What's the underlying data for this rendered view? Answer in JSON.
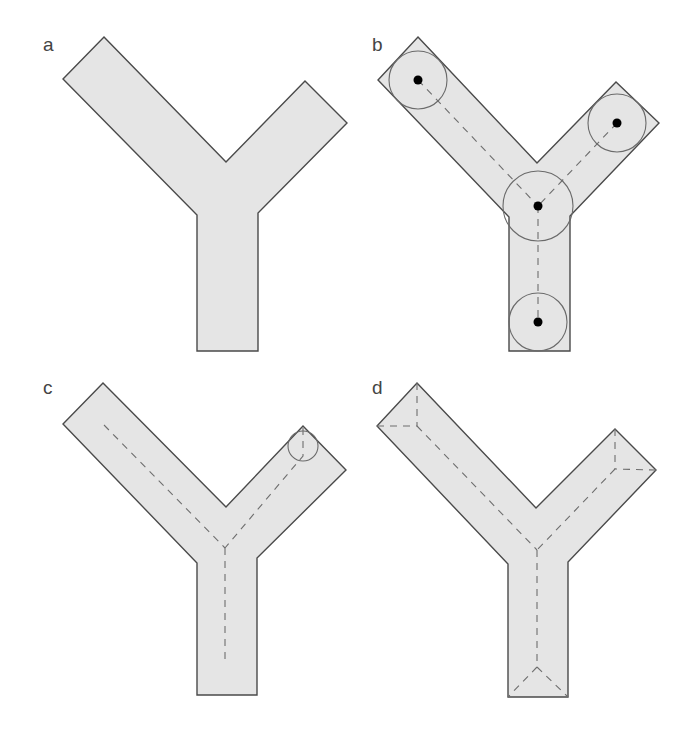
{
  "figure": {
    "fill_color": "#e5e5e5",
    "stroke_color": "#4a4a4a",
    "skeleton_color": "#6e6e6e",
    "panels": [
      {
        "label": "a",
        "label_pos": [
          43,
          51
        ],
        "shape": "Y-shaped polygon (plain)",
        "polygon": [
          [
            104,
            37
          ],
          [
            226,
            162
          ],
          [
            305,
            81
          ],
          [
            347,
            123
          ],
          [
            258,
            213
          ],
          [
            258,
            351
          ],
          [
            197,
            351
          ],
          [
            197,
            215
          ],
          [
            63,
            79
          ]
        ]
      },
      {
        "label": "b",
        "label_pos": [
          372,
          51
        ],
        "shape": "Y-shaped polygon with maximal inscribed disks and centers",
        "polygon": [
          [
            418,
            37
          ],
          [
            537,
            163
          ],
          [
            616,
            82
          ],
          [
            659,
            123
          ],
          [
            570,
            216
          ],
          [
            570,
            351
          ],
          [
            509,
            351
          ],
          [
            509,
            217
          ],
          [
            378,
            80
          ]
        ],
        "disks": [
          {
            "cx": 418,
            "cy": 80,
            "r": 29
          },
          {
            "cx": 617,
            "cy": 123,
            "r": 29
          },
          {
            "cx": 538,
            "cy": 206,
            "r": 35
          },
          {
            "cx": 538,
            "cy": 322,
            "r": 29
          }
        ],
        "skeleton": [
          [
            [
              418,
              80
            ],
            [
              538,
              206
            ]
          ],
          [
            [
              617,
              123
            ],
            [
              538,
              206
            ]
          ],
          [
            [
              538,
              206
            ],
            [
              538,
              322
            ]
          ]
        ]
      },
      {
        "label": "c",
        "label_pos": [
          43,
          394
        ],
        "shape": "Y-shaped polygon with dashed skeleton and small disk at arm tip",
        "polygon": [
          [
            103,
            383
          ],
          [
            226,
            507
          ],
          [
            303,
            426
          ],
          [
            346,
            470
          ],
          [
            257,
            558
          ],
          [
            257,
            695
          ],
          [
            197,
            695
          ],
          [
            197,
            563
          ],
          [
            63,
            424
          ]
        ],
        "disks": [
          {
            "cx": 303,
            "cy": 446,
            "r": 15
          }
        ],
        "skeleton": [
          [
            [
              104,
              425
            ],
            [
              225,
              548
            ]
          ],
          [
            [
              303,
              428
            ],
            [
              303,
              456
            ],
            [
              225,
              548
            ]
          ],
          [
            [
              225,
              548
            ],
            [
              225,
              665
            ]
          ]
        ]
      },
      {
        "label": "d",
        "label_pos": [
          372,
          394
        ],
        "shape": "Y-shaped polygon with full medial axis including corner branches",
        "polygon": [
          [
            417,
            383
          ],
          [
            536,
            508
          ],
          [
            615,
            429
          ],
          [
            656,
            470
          ],
          [
            568,
            562
          ],
          [
            568,
            697
          ],
          [
            508,
            697
          ],
          [
            508,
            564
          ],
          [
            377,
            426
          ]
        ],
        "skeleton": [
          [
            [
              417,
              383
            ],
            [
              417,
              426
            ]
          ],
          [
            [
              377,
              426
            ],
            [
              417,
              426
            ]
          ],
          [
            [
              417,
              426
            ],
            [
              537,
              550
            ]
          ],
          [
            [
              615,
              429
            ],
            [
              615,
              469
            ]
          ],
          [
            [
              656,
              470
            ],
            [
              615,
              469
            ]
          ],
          [
            [
              615,
              469
            ],
            [
              537,
              550
            ]
          ],
          [
            [
              537,
              550
            ],
            [
              537,
              667
            ]
          ],
          [
            [
              537,
              667
            ],
            [
              508,
              697
            ]
          ],
          [
            [
              537,
              667
            ],
            [
              568,
              697
            ]
          ]
        ]
      }
    ]
  }
}
